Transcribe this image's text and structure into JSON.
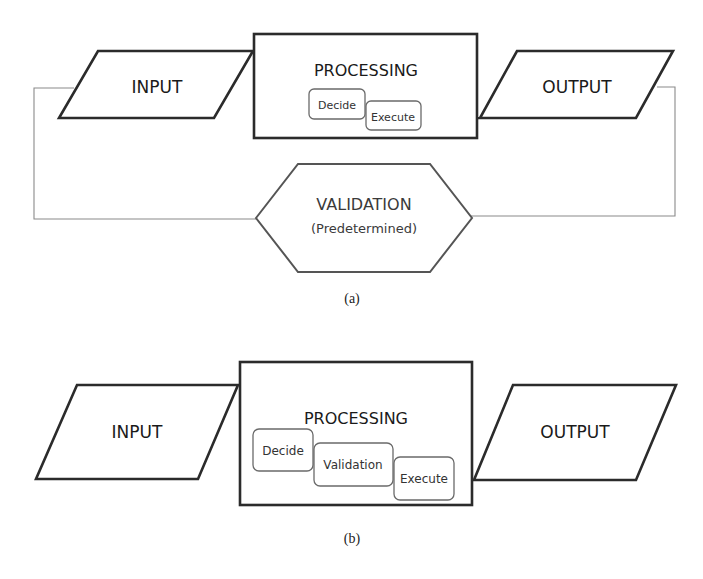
{
  "diagram_a": {
    "input_label": "INPUT",
    "processing_label": "PROCESSING",
    "processing_steps": [
      "Decide",
      "Execute"
    ],
    "output_label": "OUTPUT",
    "validation_label": "VALIDATION",
    "validation_sublabel": "(Predetermined)",
    "caption": "(a)"
  },
  "diagram_b": {
    "input_label": "INPUT",
    "processing_label": "PROCESSING",
    "processing_steps": [
      "Decide",
      "Validation",
      "Execute"
    ],
    "output_label": "OUTPUT",
    "caption": "(b)"
  },
  "colors": {
    "stroke": "#2b2b2b",
    "connector": "#8a8a8a",
    "background": "#ffffff"
  }
}
